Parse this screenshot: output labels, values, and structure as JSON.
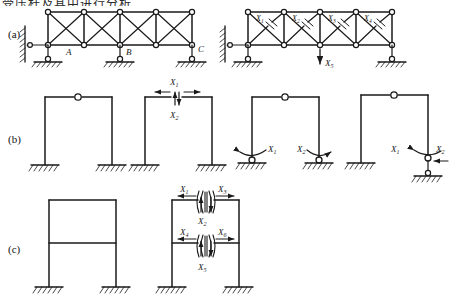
{
  "figure": {
    "type": "engineering-diagram",
    "top_partial_text": "受压杆及其中进行分析",
    "rows": [
      {
        "id": "a",
        "label": "(a)",
        "label_x": 8,
        "label_y": 33,
        "items": [
          {
            "id": "a1",
            "kind": "truss",
            "node_labels": [
              {
                "text": "A",
                "x": 68,
                "y": 50
              },
              {
                "text": "B",
                "x": 128,
                "y": 50
              },
              {
                "text": "C",
                "x": 200,
                "y": 47
              }
            ],
            "force_labels": []
          },
          {
            "id": "a2",
            "kind": "truss-released",
            "node_labels": [],
            "force_labels": [
              {
                "text": "X",
                "sub": "1",
                "x": 258,
                "y": 16
              },
              {
                "text": "X",
                "sub": "2",
                "x": 298,
                "y": 16
              },
              {
                "text": "X",
                "sub": "3",
                "x": 338,
                "y": 16
              },
              {
                "text": "X",
                "sub": "4",
                "x": 378,
                "y": 16
              },
              {
                "text": "X",
                "sub": "5",
                "x": 313,
                "y": 62
              }
            ]
          }
        ]
      },
      {
        "id": "b",
        "label": "(b)",
        "label_x": 8,
        "label_y": 140,
        "items": [
          {
            "id": "b1",
            "kind": "three-hinge-frame",
            "force_labels": []
          },
          {
            "id": "b2",
            "kind": "frame-cut-at-crown",
            "force_labels": [
              {
                "text": "X",
                "sub": "1",
                "x": 171,
                "y": 78
              },
              {
                "text": "X",
                "sub": "2",
                "x": 171,
                "y": 114
              }
            ]
          },
          {
            "id": "b3",
            "kind": "frame-released-moments",
            "force_labels": [
              {
                "text": "X",
                "sub": "1",
                "x": 277,
                "y": 150
              },
              {
                "text": "X",
                "sub": "2",
                "x": 305,
                "y": 150
              }
            ]
          },
          {
            "id": "b4",
            "kind": "frame-released-moment-and-thrust",
            "force_labels": [
              {
                "text": "X",
                "sub": "1",
                "x": 395,
                "y": 150
              },
              {
                "text": "X",
                "sub": "2",
                "x": 432,
                "y": 150
              }
            ]
          }
        ]
      },
      {
        "id": "c",
        "label": "(c)",
        "label_x": 8,
        "label_y": 250,
        "items": [
          {
            "id": "c1",
            "kind": "two-story-frame",
            "force_labels": []
          },
          {
            "id": "c2",
            "kind": "two-story-frame-cut-beams",
            "force_labels": [
              {
                "text": "X",
                "sub": "1",
                "x": 188,
                "y": 190
              },
              {
                "text": "X",
                "sub": "3",
                "x": 222,
                "y": 190
              },
              {
                "text": "X",
                "sub": "2",
                "x": 205,
                "y": 219
              },
              {
                "text": "X",
                "sub": "4",
                "x": 188,
                "y": 232
              },
              {
                "text": "X",
                "sub": "6",
                "x": 222,
                "y": 232
              },
              {
                "text": "X",
                "sub": "5",
                "x": 205,
                "y": 264
              }
            ]
          }
        ]
      }
    ],
    "colors": {
      "ink": "#1a1a1a",
      "paper": "#ffffff"
    }
  }
}
